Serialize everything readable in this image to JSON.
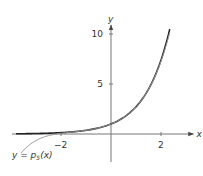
{
  "chart_data": {
    "type": "line",
    "title": "",
    "xlabel": "x",
    "ylabel": "y",
    "xlim": [
      -4.0,
      2.9
    ],
    "ylim": [
      -1.1,
      11.0
    ],
    "x_ticks": [
      {
        "value": -2,
        "label": "−2"
      },
      {
        "value": 2,
        "label": "2"
      }
    ],
    "y_ticks": [
      {
        "value": 5,
        "label": "5"
      },
      {
        "value": 10,
        "label": "10"
      }
    ],
    "grid": false,
    "series": [
      {
        "name": "f(x) = e^x",
        "color": "#222222",
        "function": "exp",
        "domain": [
          -3.8,
          2.35
        ],
        "points": [
          [
            -3.8,
            0.02
          ],
          [
            -3,
            0.05
          ],
          [
            -2,
            0.14
          ],
          [
            -1,
            0.37
          ],
          [
            0,
            1
          ],
          [
            1,
            2.72
          ],
          [
            2,
            7.39
          ],
          [
            2.35,
            10.49
          ]
        ]
      },
      {
        "name": "y = p5(x)",
        "color": "#9a9a9a",
        "function": "taylor5_exp",
        "domain": [
          -3.6,
          2.35
        ],
        "points": [
          [
            -3.6,
            -1.94
          ],
          [
            -3,
            -0.65
          ],
          [
            -2,
            0.07
          ],
          [
            -1,
            0.37
          ],
          [
            0,
            1
          ],
          [
            1,
            2.72
          ],
          [
            2,
            7.27
          ],
          [
            2.35,
            10.2
          ]
        ]
      }
    ],
    "annotations": [
      {
        "text_prefix": "y = ",
        "text_func": "p",
        "text_sub": "5",
        "text_suffix": "(x)",
        "attached_to": "y = p5(x)",
        "placement": "bottom-left"
      }
    ]
  }
}
